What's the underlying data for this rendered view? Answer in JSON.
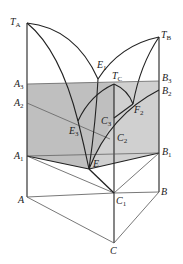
{
  "diagram": {
    "colors": {
      "line": "#222222",
      "thin_line": "#555555",
      "section_fill": "#c8c8c8",
      "section_fill_dark": "#b4b4b4"
    },
    "labels": {
      "TA": {
        "main": "T",
        "sub": "A"
      },
      "TB": {
        "main": "T",
        "sub": "B"
      },
      "TC": {
        "main": "T",
        "sub": "C"
      },
      "E1": {
        "main": "E",
        "sub": "1"
      },
      "E3": {
        "main": "E",
        "sub": "3"
      },
      "E": {
        "main": "E",
        "sub": ""
      },
      "A3": {
        "main": "A",
        "sub": "3"
      },
      "A2": {
        "main": "A",
        "sub": "2"
      },
      "A1": {
        "main": "A",
        "sub": "1"
      },
      "A": {
        "main": "A",
        "sub": ""
      },
      "B3": {
        "main": "B",
        "sub": "3"
      },
      "B2": {
        "main": "B",
        "sub": "2"
      },
      "B1": {
        "main": "B",
        "sub": "1"
      },
      "B": {
        "main": "B",
        "sub": ""
      },
      "C3": {
        "main": "C",
        "sub": "3"
      },
      "C2": {
        "main": "C",
        "sub": "2"
      },
      "C1": {
        "main": "C",
        "sub": "1"
      },
      "C": {
        "main": "C",
        "sub": ""
      },
      "F2": {
        "main": "F",
        "sub": "2"
      }
    }
  }
}
